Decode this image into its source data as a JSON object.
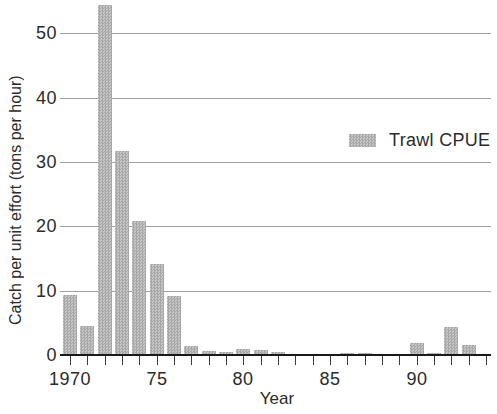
{
  "colors": {
    "background": "#ffffff",
    "bar_fill_light": "#c6c6c6",
    "bar_fill_dark": "#a7a7a7",
    "gridline": "#a0a0a0",
    "axis_line": "#1a1a1a",
    "text": "#2b2b2b"
  },
  "chart_data": {
    "type": "bar",
    "title": "",
    "xlabel": "Year",
    "ylabel": "Catch per unit effort (tons per hour)",
    "grid": "horizontal-only",
    "legend_position": "inside-right-middle",
    "x": [
      1970,
      1971,
      1972,
      1973,
      1974,
      1975,
      1976,
      1977,
      1978,
      1979,
      1980,
      1981,
      1982,
      1983,
      1984,
      1985,
      1986,
      1987,
      1988,
      1989,
      1990,
      1991,
      1992,
      1993,
      1994
    ],
    "series": [
      {
        "name": "Trawl CPUE",
        "values": [
          9.4,
          4.5,
          54.5,
          31.7,
          20.9,
          14.2,
          9.2,
          1.4,
          0.6,
          0.4,
          0.9,
          0.8,
          0.4,
          0,
          0,
          0,
          0.3,
          0.3,
          0,
          0,
          1.9,
          0.3,
          4.4,
          1.5,
          0
        ]
      }
    ],
    "xlim": [
      1969.4,
      1994.3
    ],
    "ylim": [
      0,
      55.2
    ],
    "yticks": [
      0,
      10,
      20,
      30,
      40,
      50
    ],
    "xtick_labels": [
      {
        "x": 1970,
        "label": "1970"
      },
      {
        "x": 1975,
        "label": "75"
      },
      {
        "x": 1980,
        "label": "80"
      },
      {
        "x": 1985,
        "label": "85"
      },
      {
        "x": 1990,
        "label": "90"
      }
    ]
  }
}
